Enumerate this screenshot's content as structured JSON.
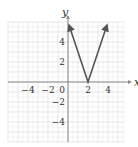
{
  "chart_data": {
    "type": "line",
    "title": "",
    "xlabel": "x",
    "ylabel": "y",
    "xlim": [
      -6,
      5.7
    ],
    "ylim": [
      -6,
      6
    ],
    "grid": true,
    "x_ticks": [
      -4,
      -2,
      0,
      2,
      4
    ],
    "x_tick_labels": [
      "−4",
      "−2",
      "0",
      "2",
      "4"
    ],
    "y_ticks": [
      4,
      2,
      -2,
      -4
    ],
    "y_tick_labels": [
      "4",
      "2",
      "−2",
      "−4"
    ],
    "series": [
      {
        "name": "y = 3|x − 2|",
        "x": [
          0.1,
          2,
          3.9
        ],
        "y": [
          5.7,
          0,
          5.7
        ],
        "color": "#555555",
        "arrows": "both-ends"
      }
    ],
    "legend": null
  },
  "colors": {
    "grid": "#d8d8d8",
    "axis": "#777777",
    "curve": "#555555"
  }
}
